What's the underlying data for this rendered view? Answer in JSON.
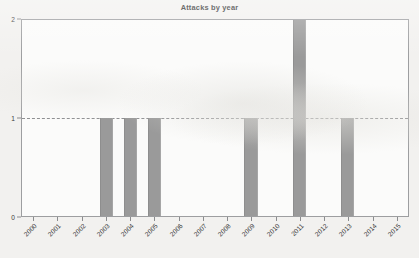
{
  "chart_data": {
    "type": "bar",
    "title": "Attacks by year",
    "xlabel": "",
    "ylabel": "",
    "categories": [
      "2000",
      "2001",
      "2002",
      "2003",
      "2004",
      "2005",
      "2006",
      "2007",
      "2008",
      "2009",
      "2010",
      "2011",
      "2012",
      "2013",
      "2014",
      "2015"
    ],
    "values": [
      0,
      0,
      0,
      1,
      1,
      1,
      0,
      0,
      0,
      1,
      0,
      2,
      0,
      1,
      0,
      0
    ],
    "ylim": [
      0,
      2
    ],
    "yticks": [
      "0",
      "1",
      "2"
    ],
    "gridlines": [
      "1"
    ],
    "grid": "dashed horizontal gridline at y=1",
    "legend": "none",
    "bar_color": "#9a9a9a",
    "background_color": "#f2f1ef",
    "frame_color": "#9d9ea0",
    "axis_text_color": "#3a3a3a",
    "xtick_rotation": "-45"
  }
}
